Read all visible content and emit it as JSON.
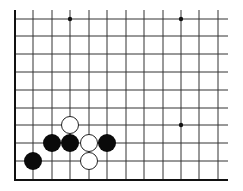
{
  "diagram": {
    "type": "go-board-fragment",
    "colors": {
      "background": "#ffffff",
      "line": "#333333",
      "border": "#111111",
      "black_stone": "#0a0a0a",
      "white_stone_fill": "#ffffff",
      "white_stone_stroke": "#222222",
      "star_point": "#111111"
    },
    "grid": {
      "columns_x": [
        15,
        33,
        52,
        70,
        89,
        107,
        126,
        144,
        163,
        181,
        199,
        218
      ],
      "rows_y": [
        19,
        36,
        54,
        72,
        90,
        108,
        125,
        143,
        161,
        180
      ],
      "top_extent": 10,
      "right_extent": 228,
      "left_border_x": 15,
      "bottom_border_y": 180
    },
    "star_points": [
      {
        "x": 70,
        "y": 19
      },
      {
        "x": 181,
        "y": 19
      },
      {
        "x": 181,
        "y": 125
      }
    ],
    "stone_radius": 9,
    "stones": [
      {
        "color": "black",
        "x": 33,
        "y": 161
      },
      {
        "color": "black",
        "x": 52,
        "y": 143
      },
      {
        "color": "black",
        "x": 70,
        "y": 143
      },
      {
        "color": "black",
        "x": 107,
        "y": 143
      },
      {
        "color": "white",
        "x": 70,
        "y": 125
      },
      {
        "color": "white",
        "x": 89,
        "y": 143
      },
      {
        "color": "white",
        "x": 89,
        "y": 161
      }
    ]
  }
}
